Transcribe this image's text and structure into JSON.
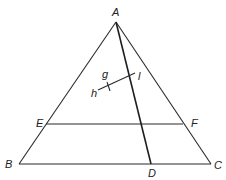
{
  "diagram": {
    "type": "geometry",
    "points": {
      "A": "A",
      "B": "B",
      "C": "C",
      "D": "D",
      "E": "E",
      "F": "F"
    },
    "segment_labels": {
      "g": "g",
      "h": "h",
      "l": "l"
    },
    "segments": [
      {
        "name": "AB",
        "from": "A",
        "to": "B"
      },
      {
        "name": "AC",
        "from": "A",
        "to": "C"
      },
      {
        "name": "BC",
        "from": "B",
        "to": "C"
      },
      {
        "name": "EF",
        "from": "E",
        "to": "F"
      },
      {
        "name": "AD",
        "from": "A",
        "to": "D"
      },
      {
        "name": "hl",
        "from": "h",
        "to": "l"
      }
    ],
    "colors": {
      "stroke": "#2a2a2a",
      "background": "#ffffff"
    }
  }
}
